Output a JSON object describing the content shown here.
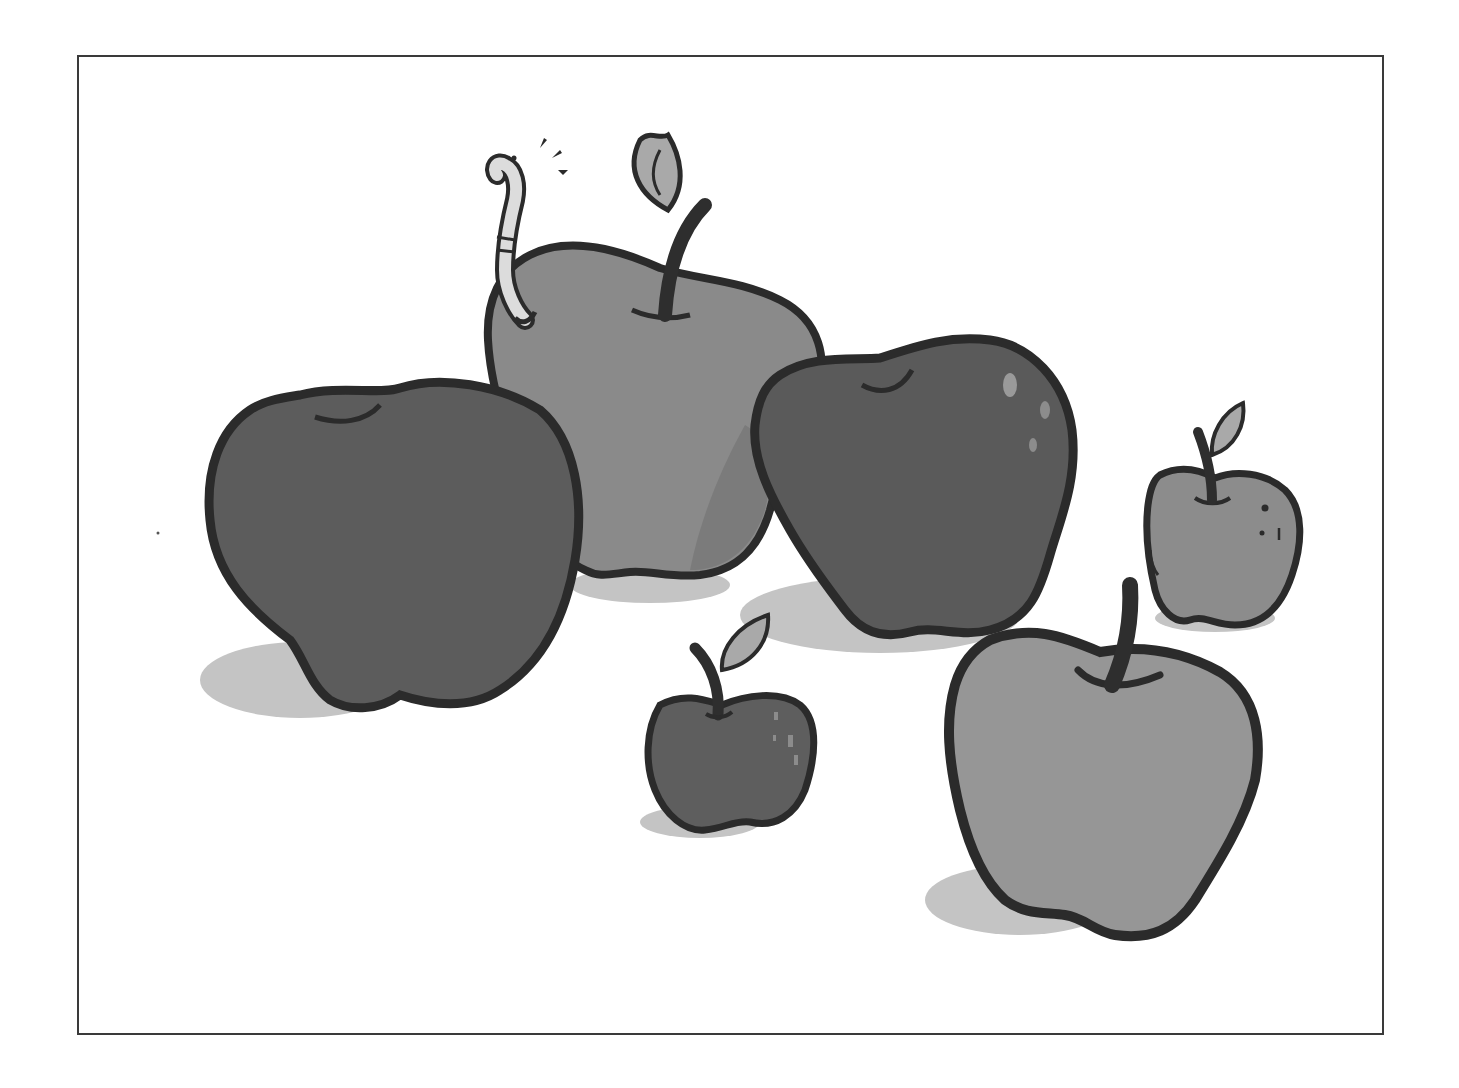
{
  "image": {
    "description": "Grayscale cartoon illustration of six apples of varying sizes inside a thin rectangular frame; one apple has a worm poking out of it",
    "frame": {
      "left": 77,
      "top": 55,
      "right": 1382,
      "bottom": 1033,
      "stroke": "#3a3a3a"
    },
    "colors": {
      "background": "#ffffff",
      "outline": "#2b2b2b",
      "dark_apple": "#5c5c5c",
      "mid_apple": "#8a8a8a",
      "light_apple": "#969696",
      "shadow": "#c4c4c4",
      "leaf": "#a9a9a9",
      "stem": "#2e2e2e",
      "worm": "#dcdcdc",
      "highlight": "#9a9a9a"
    },
    "apples": [
      {
        "name": "large-dark-apple-left",
        "fill": "dark",
        "has_stem": false,
        "has_leaf": false
      },
      {
        "name": "center-back-apple-with-worm",
        "fill": "mid",
        "has_stem": true,
        "has_leaf": true,
        "has_worm": true
      },
      {
        "name": "dark-apple-right-center",
        "fill": "dark",
        "has_stem": false,
        "has_leaf": false,
        "highlights": 3
      },
      {
        "name": "small-apple-far-right",
        "fill": "mid",
        "has_stem": true,
        "has_leaf": true
      },
      {
        "name": "small-dark-apple-bottom-center",
        "fill": "dark",
        "has_stem": true,
        "has_leaf": true
      },
      {
        "name": "large-light-apple-bottom-right",
        "fill": "light",
        "has_stem": true,
        "has_leaf": false
      }
    ],
    "apple_count": 6
  }
}
